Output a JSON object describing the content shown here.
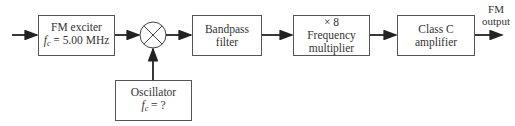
{
  "blocks": {
    "exciter": {
      "line1": "FM exciter",
      "freq_symbol": "f",
      "freq_sub": "c",
      "freq_value": " = 5.00 MHz"
    },
    "mixer": {
      "symbol": "mixer"
    },
    "bandpass": {
      "line1": "Bandpass",
      "line2": "filter"
    },
    "multiplier": {
      "line1": "× 8",
      "line2": "Frequency",
      "line3": "multiplier"
    },
    "amplifier": {
      "line1": "Class C",
      "line2": "amplifier"
    },
    "oscillator": {
      "line1": "Oscillator",
      "freq_symbol": "f",
      "freq_sub": "c",
      "freq_value": " = ?"
    }
  },
  "output": {
    "line1": "FM",
    "line2": "output"
  },
  "colors": {
    "line": "#222222",
    "box_border": "#555555"
  }
}
